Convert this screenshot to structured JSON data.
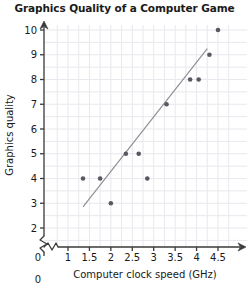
{
  "chart_data": {
    "type": "scatter",
    "title": "Graphics Quality of a Computer Game",
    "xlabel": "Computer clock speed (GHz)",
    "ylabel": "Graphics quality",
    "xlim": [
      0.85,
      4.65
    ],
    "ylim": [
      1.7,
      10.4
    ],
    "x_ticks": [
      "1",
      "1.5",
      "2",
      "2.5",
      "3",
      "3.5",
      "4",
      "4.5"
    ],
    "x_tick_values": [
      1,
      1.5,
      2,
      2.5,
      3,
      3.5,
      4,
      4.5
    ],
    "x_origin_label": "0",
    "y_ticks": [
      "2",
      "3",
      "4",
      "5",
      "6",
      "7",
      "8",
      "9",
      "10"
    ],
    "y_tick_values": [
      2,
      3,
      4,
      5,
      6,
      7,
      8,
      9,
      10
    ],
    "y_origin_label": "0",
    "grid": true,
    "grid_color": "#e8e8ee",
    "axis_color": "#3a3a3a",
    "point_color": "#595963",
    "line_color": "#8a8a92",
    "axis_break_x": true,
    "axis_break_y": true,
    "legend": null,
    "points": [
      {
        "x": 1.35,
        "y": 4
      },
      {
        "x": 1.75,
        "y": 4
      },
      {
        "x": 2.0,
        "y": 3
      },
      {
        "x": 2.35,
        "y": 5
      },
      {
        "x": 2.65,
        "y": 5
      },
      {
        "x": 2.85,
        "y": 4
      },
      {
        "x": 3.3,
        "y": 7
      },
      {
        "x": 3.85,
        "y": 8
      },
      {
        "x": 4.05,
        "y": 8
      },
      {
        "x": 4.3,
        "y": 9
      },
      {
        "x": 4.5,
        "y": 10
      }
    ],
    "trend_line": {
      "x1": 1.35,
      "y1": 2.85,
      "x2": 4.25,
      "y2": 9.25,
      "description": "line of best fit"
    }
  }
}
